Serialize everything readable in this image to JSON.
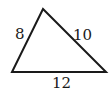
{
  "figure": {
    "shape": "triangle",
    "vertices": {
      "apex": [
        43,
        9
      ],
      "bottom_left": [
        12,
        72
      ],
      "bottom_right": [
        106,
        72
      ]
    },
    "side_labels": {
      "left": "8",
      "right": "10",
      "bottom": "12"
    },
    "stroke_color": "#1a1a1a"
  }
}
